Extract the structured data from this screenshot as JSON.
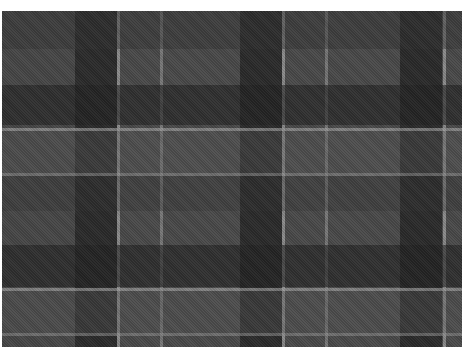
{
  "caption": {
    "text": "",
    "note": "clipped, illegible"
  },
  "plaid": {
    "base_color": "#4a4a4a",
    "vertical_bands": [
      {
        "x": 0,
        "w": 73,
        "color": "#444444",
        "opacity": 0.5
      },
      {
        "x": 73,
        "w": 42,
        "color": "#222222",
        "opacity": 0.75
      },
      {
        "x": 115,
        "w": 3,
        "color": "#9a9a9a",
        "opacity": 0.8
      },
      {
        "x": 158,
        "w": 3,
        "color": "#8a8a8a",
        "opacity": 0.7
      },
      {
        "x": 238,
        "w": 42,
        "color": "#222222",
        "opacity": 0.75
      },
      {
        "x": 280,
        "w": 3,
        "color": "#9a9a9a",
        "opacity": 0.8
      },
      {
        "x": 323,
        "w": 3,
        "color": "#8a8a8a",
        "opacity": 0.7
      },
      {
        "x": 398,
        "w": 42,
        "color": "#222222",
        "opacity": 0.75
      },
      {
        "x": 441,
        "w": 3,
        "color": "#9a9a9a",
        "opacity": 0.8
      }
    ],
    "horizontal_bands": [
      {
        "y": 0,
        "h": 38,
        "color": "#333333",
        "opacity": 0.45
      },
      {
        "y": 74,
        "h": 40,
        "color": "#222222",
        "opacity": 0.6
      },
      {
        "y": 117,
        "h": 3,
        "color": "#9a9a9a",
        "opacity": 0.7
      },
      {
        "y": 120,
        "h": 42,
        "color": "#5a5a5a",
        "opacity": 0.35
      },
      {
        "y": 162,
        "h": 3,
        "color": "#8a8a8a",
        "opacity": 0.6
      },
      {
        "y": 165,
        "h": 35,
        "color": "#333333",
        "opacity": 0.35
      },
      {
        "y": 234,
        "h": 42,
        "color": "#222222",
        "opacity": 0.6
      },
      {
        "y": 277,
        "h": 3,
        "color": "#9a9a9a",
        "opacity": 0.7
      },
      {
        "y": 280,
        "h": 42,
        "color": "#555555",
        "opacity": 0.35
      },
      {
        "y": 322,
        "h": 3,
        "color": "#8a8a8a",
        "opacity": 0.6
      }
    ]
  }
}
